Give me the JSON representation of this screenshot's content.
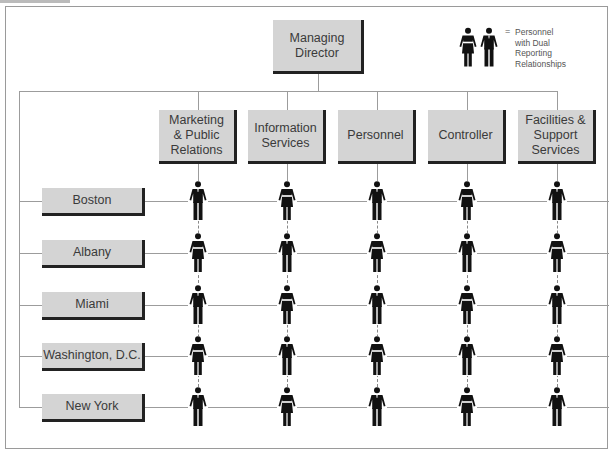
{
  "diagram": {
    "type": "org-chart-matrix",
    "root": {
      "label": "Managing Director"
    },
    "legend": {
      "symbol": "=",
      "text": "Personnel with Dual Reporting Relationships",
      "lines": [
        "Personnel",
        "with Dual",
        "Reporting",
        "Relationships"
      ]
    },
    "departments": [
      {
        "label": "Marketing & Public Relations",
        "lines": [
          "Marketing",
          "& Public",
          "Relations"
        ]
      },
      {
        "label": "Information Services",
        "lines": [
          "Information",
          "Services"
        ]
      },
      {
        "label": "Personnel",
        "lines": [
          "Personnel"
        ]
      },
      {
        "label": "Controller",
        "lines": [
          "Controller"
        ]
      },
      {
        "label": "Facilities & Support Services",
        "lines": [
          "Facilities &",
          "Support",
          "Services"
        ]
      }
    ],
    "offices": [
      {
        "label": "Boston",
        "staff": [
          "male",
          "female",
          "male",
          "female",
          "male"
        ]
      },
      {
        "label": "Albany",
        "staff": [
          "female",
          "male",
          "female",
          "male",
          "female"
        ]
      },
      {
        "label": "Miami",
        "staff": [
          "male",
          "female",
          "male",
          "female",
          "male"
        ]
      },
      {
        "label": "Washington, D.C.",
        "staff": [
          "female",
          "male",
          "female",
          "male",
          "female"
        ]
      },
      {
        "label": "New York",
        "staff": [
          "male",
          "female",
          "male",
          "female",
          "male"
        ]
      }
    ],
    "colors": {
      "box_fill": "#d4d4d4",
      "box_shadow": "#222222",
      "line": "#9c9c9c",
      "figure": "#111111"
    }
  }
}
